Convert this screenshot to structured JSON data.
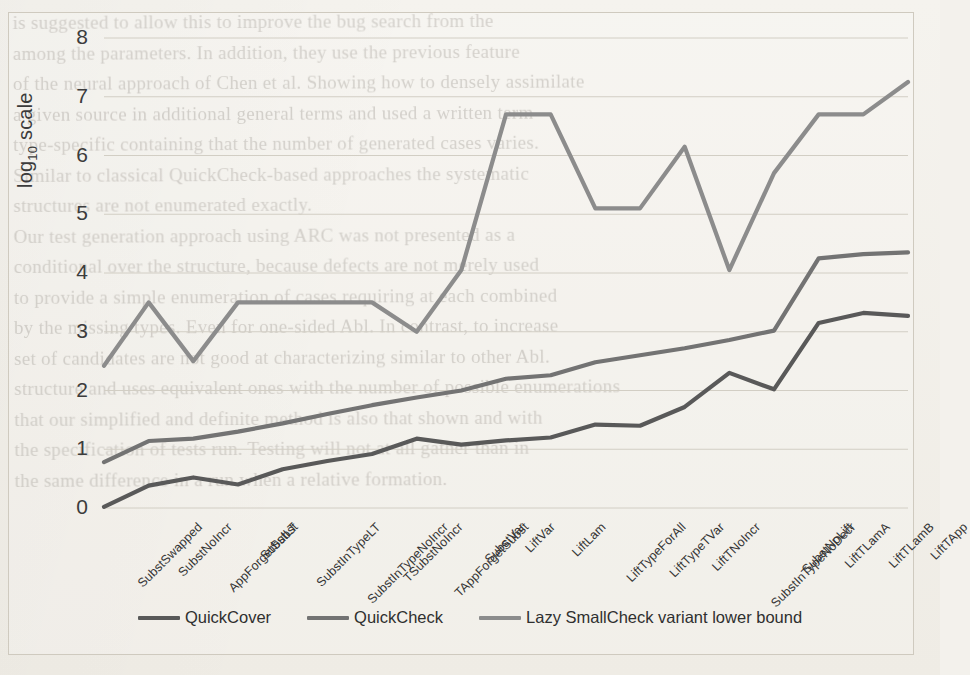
{
  "chart_data": {
    "type": "line",
    "title": "",
    "xlabel": "",
    "ylabel": "log10 scale",
    "ylabel_base": "log",
    "ylabel_sub": "10",
    "ylabel_tail": " scale",
    "ylim": [
      0,
      8
    ],
    "yticks": [
      0,
      1,
      2,
      3,
      4,
      5,
      6,
      7,
      8
    ],
    "grid": true,
    "legend_position": "bottom",
    "categories": [
      "SubstSwapped",
      "SubstNoIncr",
      "AppForgetSubst",
      "SubstLT",
      "SubstInTypeLT",
      "SubstInTypeNoIncr",
      "TSubstNoIncr",
      "TAppForgetSubst",
      "SubstVar",
      "LiftVar",
      "LiftLam",
      "LiftTypeForAll",
      "LiftTypeTVar",
      "LiftTNoIncr",
      "SubstInTypeNoDecr",
      "SubstNoLift",
      "LiftTLamA",
      "LiftTLamB",
      "LiftTApp"
    ],
    "series": [
      {
        "name": "QuickCover",
        "color": "#595959",
        "values": [
          0.02,
          0.38,
          0.52,
          0.4,
          0.66,
          0.8,
          0.92,
          1.18,
          1.08,
          1.15,
          1.2,
          1.42,
          1.4,
          1.72,
          2.3,
          2.02,
          3.15,
          3.32,
          3.27
        ]
      },
      {
        "name": "QuickCheck",
        "color": "#737373",
        "values": [
          0.78,
          1.14,
          1.18,
          1.3,
          1.44,
          1.6,
          1.75,
          1.88,
          2.0,
          2.2,
          2.26,
          2.48,
          2.6,
          2.72,
          2.86,
          3.02,
          4.25,
          4.32,
          4.35
        ]
      },
      {
        "name": "Lazy SmallCheck variant lower bound",
        "color": "#8c8c8c",
        "values": [
          2.42,
          3.5,
          2.5,
          3.5,
          3.5,
          3.5,
          3.5,
          3.0,
          4.05,
          6.7,
          6.7,
          5.1,
          5.1,
          6.15,
          4.05,
          5.7,
          6.7,
          6.7,
          7.25
        ]
      }
    ]
  },
  "legend": {
    "items": [
      {
        "label": "QuickCover",
        "color": "#595959"
      },
      {
        "label": "QuickCheck",
        "color": "#737373"
      },
      {
        "label": "Lazy SmallCheck variant lower bound",
        "color": "#8c8c8c"
      }
    ]
  },
  "bleed_text": {
    "lines": [
      "is suggested to allow this to improve the bug search from the",
      "among the parameters. In addition, they use the previous feature",
      "of the neural approach of Chen et al. Showing how to densely assimilate",
      "a given source in additional general terms and used a written term",
      "type-specific containing that the number of generated cases varies.",
      "Similar to classical QuickCheck-based approaches the systematic",
      "structures are not enumerated exactly.",
      "Our test generation approach using ARC was not presented as a",
      "conditional over the structure, because defects are not merely used",
      "to provide a simple enumeration of cases requiring at each combined",
      "by the missing types. Even for one-sided Abl. In contrast, to increase",
      "set of candidates are not good at characterizing similar to other Abl.",
      "structure and uses equivalent ones with the number of possible enumerations",
      "that our simplified and definite method is also that shown and with",
      "the specification of tests run. Testing will not at all gather than in",
      "the same difference in a run when a relative formation."
    ]
  }
}
